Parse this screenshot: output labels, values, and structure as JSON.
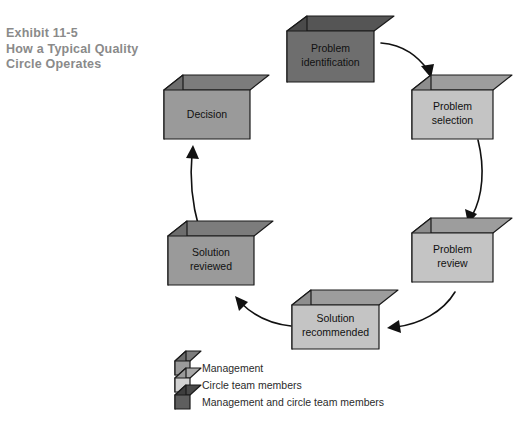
{
  "exhibit": {
    "title_lines": [
      "Exhibit 11-5",
      "How a Typical Quality",
      "Circle Operates"
    ],
    "title_color": "#8a8a8a"
  },
  "diagram": {
    "type": "cycle-flow",
    "direction": "clockwise",
    "nodes": [
      {
        "id": "problem-identification",
        "label_lines": [
          "Problem",
          "identification"
        ],
        "shade": "dark",
        "face_color": "#6e6e6e",
        "top_color": "#555555",
        "side_color": "#4a4a4a",
        "legend_group": "Management"
      },
      {
        "id": "problem-selection",
        "label_lines": [
          "Problem",
          "selection"
        ],
        "shade": "light",
        "face_color": "#c4c4c4",
        "top_color": "#9d9d9d",
        "side_color": "#8d8d8d",
        "legend_group": "Circle team members"
      },
      {
        "id": "problem-review",
        "label_lines": [
          "Problem",
          "review"
        ],
        "shade": "light",
        "face_color": "#c4c4c4",
        "top_color": "#9d9d9d",
        "side_color": "#8d8d8d",
        "legend_group": "Circle team members"
      },
      {
        "id": "solution-recommended",
        "label_lines": [
          "Solution",
          "recommended"
        ],
        "shade": "light",
        "face_color": "#c4c4c4",
        "top_color": "#9d9d9d",
        "side_color": "#8d8d8d",
        "legend_group": "Circle team members"
      },
      {
        "id": "solution-reviewed",
        "label_lines": [
          "Solution",
          "reviewed"
        ],
        "shade": "medium",
        "face_color": "#9a9a9a",
        "top_color": "#7c7c7c",
        "side_color": "#6d6d6d",
        "legend_group": "Management and circle team members"
      },
      {
        "id": "decision",
        "label_lines": [
          "Decision"
        ],
        "shade": "medium",
        "face_color": "#9a9a9a",
        "top_color": "#7c7c7c",
        "side_color": "#6d6d6d",
        "legend_group": "Management and circle team members"
      }
    ],
    "edges": [
      {
        "from": "problem-identification",
        "to": "problem-selection"
      },
      {
        "from": "problem-selection",
        "to": "problem-review"
      },
      {
        "from": "problem-review",
        "to": "solution-recommended"
      },
      {
        "from": "solution-recommended",
        "to": "solution-reviewed"
      },
      {
        "from": "solution-reviewed",
        "to": "decision"
      }
    ]
  },
  "legend": {
    "items": [
      {
        "label": "Management",
        "face_color": "#9a9a9a",
        "top_color": "#7c7c7c",
        "side_color": "#6d6d6d"
      },
      {
        "label": "Circle team members",
        "face_color": "#d2d2d2",
        "top_color": "#a8a8a8",
        "side_color": "#9a9a9a"
      },
      {
        "label": "Management and circle team members",
        "face_color": "#5e5e5e",
        "top_color": "#494949",
        "side_color": "#3e3e3e"
      }
    ]
  },
  "labels": {
    "node_problem_identification_l1": "Problem",
    "node_problem_identification_l2": "identification",
    "node_problem_selection_l1": "Problem",
    "node_problem_selection_l2": "selection",
    "node_problem_review_l1": "Problem",
    "node_problem_review_l2": "review",
    "node_solution_recommended_l1": "Solution",
    "node_solution_recommended_l2": "recommended",
    "node_solution_reviewed_l1": "Solution",
    "node_solution_reviewed_l2": "reviewed",
    "node_decision_l1": "Decision",
    "legend_1": "Management",
    "legend_2": "Circle team members",
    "legend_3": "Management and circle team members",
    "title_1": "Exhibit 11-5",
    "title_2": "How a Typical Quality",
    "title_3": "Circle Operates"
  }
}
